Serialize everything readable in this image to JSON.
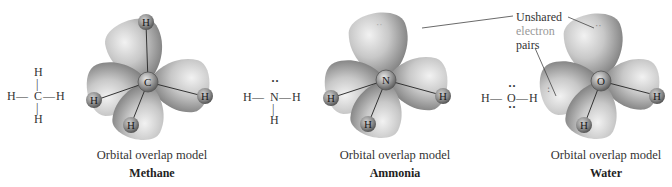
{
  "figure": {
    "panels": [
      {
        "id": "methane",
        "lewis": {
          "center": "C",
          "top": "H",
          "left": "H",
          "right": "H",
          "bottom": "H",
          "bond_h": "—",
          "bond_v": "|"
        },
        "orbital_model": {
          "center_atom": "C",
          "hydrogens": [
            "H",
            "H",
            "H",
            "H"
          ]
        },
        "caption": "Orbital overlap model",
        "name": "Methane"
      },
      {
        "id": "ammonia",
        "lewis": {
          "center": "N",
          "lone_pair": "··",
          "left": "H",
          "right": "H",
          "bottom": "H",
          "bond_h": "—",
          "bond_v": "|"
        },
        "orbital_model": {
          "center_atom": "N",
          "hydrogens": [
            "H",
            "H",
            "H"
          ],
          "lone_pair_mark": "··"
        },
        "caption": "Orbital overlap model",
        "name": "Ammonia"
      },
      {
        "id": "water",
        "lewis": {
          "center": "O",
          "lone_pair_top": "··",
          "lone_pair_bottom": "··",
          "left": "H",
          "right": "H",
          "bond_h": "—"
        },
        "orbital_model": {
          "center_atom": "O",
          "hydrogens": [
            "H",
            "H"
          ],
          "lone_pair_mark": "··"
        },
        "caption": "Orbital overlap model",
        "name": "Water"
      }
    ],
    "annotation": {
      "line1": "Unshared",
      "line2": "electron",
      "line3": "pairs"
    },
    "colors": {
      "lobe_light": "#e6e6e6",
      "lobe_mid": "#b5b5b5",
      "lobe_dark": "#7d7d7d",
      "atom": "#8c8c8c",
      "text": "#2b2b2b"
    }
  }
}
